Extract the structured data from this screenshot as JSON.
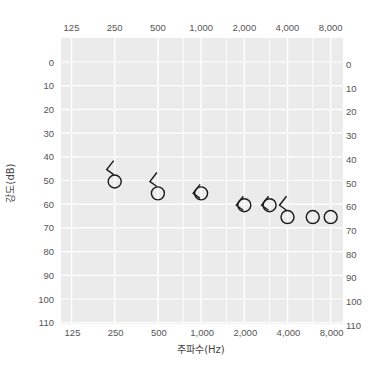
{
  "chart_data": {
    "type": "scatter",
    "title": "",
    "xlabel": "주파수(Hz)",
    "ylabel": "강도(dB)",
    "x_scale": "log2",
    "x_ticks": [
      "125",
      "250",
      "500",
      "1,000",
      "2,000",
      "4,000",
      "8,000"
    ],
    "x_tick_values": [
      125,
      250,
      500,
      1000,
      2000,
      4000,
      8000
    ],
    "x_minor_gridlines": [
      750,
      1500,
      3000,
      6000
    ],
    "y_ticks": [
      0,
      10,
      20,
      30,
      40,
      50,
      60,
      70,
      80,
      90,
      100,
      110
    ],
    "ylim": [
      110,
      -10
    ],
    "y_inverted": true,
    "grid": true,
    "legend": null,
    "series": [
      {
        "name": "air-conduction-right (O)",
        "marker": "circle",
        "points": [
          {
            "x": 250,
            "y": 50
          },
          {
            "x": 500,
            "y": 55
          },
          {
            "x": 1000,
            "y": 55
          },
          {
            "x": 2000,
            "y": 60
          },
          {
            "x": 3000,
            "y": 60
          },
          {
            "x": 4000,
            "y": 65
          },
          {
            "x": 6000,
            "y": 65
          },
          {
            "x": 8000,
            "y": 65
          }
        ]
      },
      {
        "name": "bone-conduction-right (<)",
        "marker": "bracket-left",
        "points": [
          {
            "x": 250,
            "y": 45
          },
          {
            "x": 500,
            "y": 50
          },
          {
            "x": 1000,
            "y": 55
          },
          {
            "x": 2000,
            "y": 60
          },
          {
            "x": 3000,
            "y": 60
          },
          {
            "x": 4000,
            "y": 60
          }
        ]
      }
    ]
  },
  "labels": {
    "xlabel": "주파수(Hz)",
    "ylabel": "강도(dB)",
    "x_ticks": [
      "125",
      "250",
      "500",
      "1,000",
      "2,000",
      "4,000",
      "8,000"
    ],
    "y_ticks": [
      "0",
      "10",
      "20",
      "30",
      "40",
      "50",
      "60",
      "70",
      "80",
      "90",
      "100",
      "110"
    ]
  },
  "colors": {
    "plot_bg": "#ebebeb",
    "grid": "#ffffff",
    "marker": "#1a1a1a",
    "text": "#555555"
  }
}
